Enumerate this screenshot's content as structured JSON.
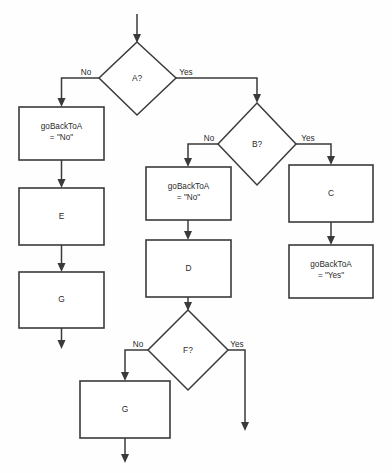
{
  "diagram": {
    "type": "flowchart",
    "background_color": "#fefefe",
    "line_color": "#3a3a3a",
    "text_color": "#2b2b2b",
    "nodes": {
      "decision_a": {
        "label": "A?",
        "shape": "diamond"
      },
      "process_gobacktoa_no_left": {
        "line1": "goBackToA",
        "line2": "= \"No\"",
        "shape": "rectangle"
      },
      "process_e": {
        "label": "E",
        "shape": "rectangle"
      },
      "process_g_left": {
        "label": "G",
        "shape": "rectangle"
      },
      "decision_b": {
        "label": "B?",
        "shape": "diamond"
      },
      "process_gobacktoa_no_middle": {
        "line1": "goBackToA",
        "line2": "= \"No\"",
        "shape": "rectangle"
      },
      "process_d": {
        "label": "D",
        "shape": "rectangle"
      },
      "process_c": {
        "label": "C",
        "shape": "rectangle"
      },
      "process_gobacktoa_yes": {
        "line1": "goBackToA",
        "line2": "= \"Yes\"",
        "shape": "rectangle"
      },
      "decision_f": {
        "label": "F?",
        "shape": "diamond"
      },
      "process_g_bottom": {
        "label": "G",
        "shape": "rectangle"
      }
    },
    "edge_labels": {
      "a_no": "No",
      "a_yes": "Yes",
      "b_no": "No",
      "b_yes": "Yes",
      "f_no": "No",
      "f_yes": "Yes"
    }
  }
}
